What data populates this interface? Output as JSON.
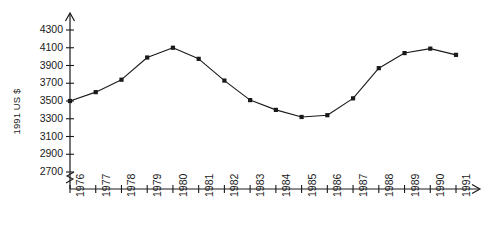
{
  "chart_data": {
    "type": "line",
    "title": "",
    "subtitle": "",
    "xlabel": "",
    "ylabel": "1991 US $",
    "grid": false,
    "legend": "none",
    "marker": "square",
    "line_color": "#1a1a1a",
    "marker_color": "#1a1a1a",
    "axis_color": "#1a1a1a",
    "background": "#ffffff",
    "y_axis_break": true,
    "axis_arrows": true,
    "xlim": [
      1976,
      1991
    ],
    "ylim": [
      2700,
      4300
    ],
    "ytick_step": 200,
    "categories": [
      "1976",
      "1977",
      "1978",
      "1979",
      "1980",
      "1981",
      "1982",
      "1983",
      "1984",
      "1985",
      "1986",
      "1987",
      "1988",
      "1989",
      "1990",
      "1991"
    ],
    "yticks": [
      "2700",
      "2900",
      "3100",
      "3300",
      "3500",
      "3700",
      "3900",
      "4100",
      "4300"
    ],
    "ytick_values": [
      2700,
      2900,
      3100,
      3300,
      3500,
      3700,
      3900,
      4100,
      4300
    ],
    "x": [
      1976,
      1977,
      1978,
      1979,
      1980,
      1981,
      1982,
      1983,
      1984,
      1985,
      1986,
      1987,
      1988,
      1989,
      1990,
      1991
    ],
    "values": [
      3500,
      3600,
      3740,
      3990,
      4100,
      3975,
      3730,
      3510,
      3400,
      3320,
      3340,
      3530,
      3870,
      4040,
      4090,
      4020
    ],
    "series": [
      {
        "name": "1991 US $",
        "values": [
          3500,
          3600,
          3740,
          3990,
          4100,
          3975,
          3730,
          3510,
          3400,
          3320,
          3340,
          3530,
          3870,
          4040,
          4090,
          4020
        ]
      }
    ],
    "annotations": []
  }
}
